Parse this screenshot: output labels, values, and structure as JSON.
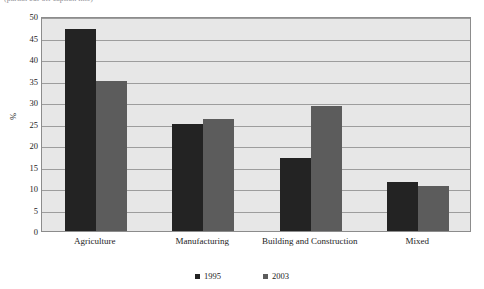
{
  "caption_sliver": "(partial cut-off caption line)",
  "chart_data": {
    "type": "bar",
    "title": "",
    "xlabel": "",
    "ylabel": "%",
    "categories": [
      "Agriculture",
      "Manufacturing",
      "Building and Construction",
      "Mixed"
    ],
    "series": [
      {
        "name": "1995",
        "color": "#232323",
        "values": [
          47,
          25,
          17,
          11.5
        ]
      },
      {
        "name": "2003",
        "color": "#5c5c5c",
        "values": [
          35,
          26,
          29,
          10.5
        ]
      }
    ],
    "ylim": [
      0,
      50
    ],
    "yticks": [
      0,
      5,
      10,
      15,
      20,
      25,
      30,
      35,
      40,
      45,
      50
    ],
    "grid": true,
    "legend_position": "bottom",
    "plot_background": "#e7e7e7",
    "gridline_color": "#9d9d9d"
  }
}
